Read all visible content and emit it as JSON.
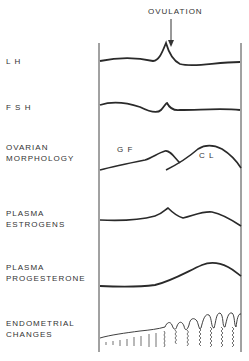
{
  "diagram": {
    "annotation": "OVULATION",
    "rows": [
      {
        "id": "lh",
        "label": "L H"
      },
      {
        "id": "fsh",
        "label": "F S H"
      },
      {
        "id": "ovarian",
        "label": "OVARIAN\nMORPHOLOGY"
      },
      {
        "id": "estrogens",
        "label": "PLASMA\nESTROGENS"
      },
      {
        "id": "progesterone",
        "label": "PLASMA\nPROGESTERONE"
      },
      {
        "id": "endometrial",
        "label": "ENDOMETRIAL\nCHANGES"
      }
    ],
    "ovarian_annotations": {
      "gf": "G F",
      "cl": "C L"
    },
    "colors": {
      "line": "#2a2a2a",
      "text": "#333333",
      "background": "#ffffff"
    }
  }
}
